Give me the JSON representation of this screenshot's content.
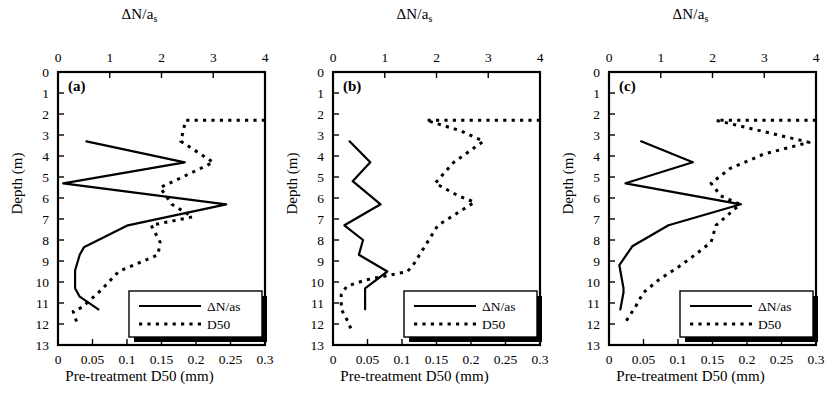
{
  "figure": {
    "width": 838,
    "height": 402,
    "background": "#ffffff",
    "line_color": "#000000"
  },
  "axes": {
    "top_title_main": "ΔN/a",
    "top_title_sub": "s",
    "bottom_title": "Pre-treatment D50 (mm)",
    "y_title": "Depth (m)",
    "top_ticks": [
      "0",
      "1",
      "2",
      "3",
      "4"
    ],
    "bottom_ticks": [
      "0",
      "0.05",
      "0.1",
      "0.15",
      "0.2",
      "0.25",
      "0.3"
    ],
    "y_ticks": [
      "0",
      "1",
      "2",
      "3",
      "4",
      "5",
      "6",
      "7",
      "8",
      "9",
      "10",
      "11",
      "12",
      "13"
    ]
  },
  "legend": {
    "series_solid_label": "ΔN/as",
    "series_dotted_label": "D50"
  },
  "chart_data": [
    {
      "type": "line",
      "panel": "a",
      "label": "(a)",
      "title": "",
      "xlabel": "Pre-treatment D50 (mm)",
      "xlabel_top": "ΔN/as",
      "ylabel": "Depth (m)",
      "ylim": [
        0,
        13
      ],
      "y_inverted": true,
      "xlim_top": [
        0,
        4
      ],
      "xlim_bottom": [
        0,
        0.3
      ],
      "grid": false,
      "legend_position": "bottom-right",
      "series": [
        {
          "name": "ΔN/as",
          "style": "solid",
          "axis": "top",
          "points": [
            {
              "x": 0.55,
              "depth": 3.3
            },
            {
              "x": 2.45,
              "depth": 4.3
            },
            {
              "x": 0.1,
              "depth": 5.3
            },
            {
              "x": 3.25,
              "depth": 6.3
            },
            {
              "x": 1.35,
              "depth": 7.3
            },
            {
              "x": 0.5,
              "depth": 8.35
            },
            {
              "x": 0.42,
              "depth": 8.7
            },
            {
              "x": 0.33,
              "depth": 9.45
            },
            {
              "x": 0.33,
              "depth": 10.3
            },
            {
              "x": 0.42,
              "depth": 10.7
            },
            {
              "x": 0.78,
              "depth": 11.3
            }
          ]
        },
        {
          "name": "D50",
          "style": "dotted",
          "axis": "bottom",
          "points": [
            {
              "x": 0.3,
              "depth": 2.3
            },
            {
              "x": 0.185,
              "depth": 2.3
            },
            {
              "x": 0.178,
              "depth": 3.3
            },
            {
              "x": 0.225,
              "depth": 4.3
            },
            {
              "x": 0.168,
              "depth": 5.2
            },
            {
              "x": 0.148,
              "depth": 5.5
            },
            {
              "x": 0.165,
              "depth": 6.3
            },
            {
              "x": 0.195,
              "depth": 6.9
            },
            {
              "x": 0.135,
              "depth": 7.3
            },
            {
              "x": 0.148,
              "depth": 8.1
            },
            {
              "x": 0.145,
              "depth": 8.7
            },
            {
              "x": 0.088,
              "depth": 9.5
            },
            {
              "x": 0.062,
              "depth": 10.4
            },
            {
              "x": 0.035,
              "depth": 11.2
            },
            {
              "x": 0.022,
              "depth": 11.4
            },
            {
              "x": 0.028,
              "depth": 12.0
            }
          ]
        }
      ]
    },
    {
      "type": "line",
      "panel": "b",
      "label": "(b)",
      "title": "",
      "xlabel": "Pre-treatment D50 (mm)",
      "xlabel_top": "ΔN/as",
      "ylabel": "Depth (m)",
      "ylim": [
        0,
        13
      ],
      "y_inverted": true,
      "xlim_top": [
        0,
        4
      ],
      "xlim_bottom": [
        0,
        0.3
      ],
      "grid": false,
      "legend_position": "bottom-right",
      "series": [
        {
          "name": "ΔN/as",
          "style": "solid",
          "axis": "top",
          "points": [
            {
              "x": 0.32,
              "depth": 3.3
            },
            {
              "x": 0.72,
              "depth": 4.3
            },
            {
              "x": 0.38,
              "depth": 5.2
            },
            {
              "x": 0.92,
              "depth": 6.3
            },
            {
              "x": 0.22,
              "depth": 7.3
            },
            {
              "x": 0.58,
              "depth": 8.0
            },
            {
              "x": 0.5,
              "depth": 8.7
            },
            {
              "x": 1.05,
              "depth": 9.5
            },
            {
              "x": 0.62,
              "depth": 10.3
            },
            {
              "x": 0.62,
              "depth": 11.3
            }
          ]
        },
        {
          "name": "D50",
          "style": "dotted",
          "axis": "bottom",
          "points": [
            {
              "x": 0.3,
              "depth": 2.3
            },
            {
              "x": 0.135,
              "depth": 2.3
            },
            {
              "x": 0.185,
              "depth": 2.8
            },
            {
              "x": 0.218,
              "depth": 3.3
            },
            {
              "x": 0.175,
              "depth": 4.3
            },
            {
              "x": 0.148,
              "depth": 5.3
            },
            {
              "x": 0.182,
              "depth": 5.9
            },
            {
              "x": 0.205,
              "depth": 6.2
            },
            {
              "x": 0.152,
              "depth": 7.3
            },
            {
              "x": 0.135,
              "depth": 8.2
            },
            {
              "x": 0.118,
              "depth": 9.1
            },
            {
              "x": 0.108,
              "depth": 9.5
            },
            {
              "x": 0.048,
              "depth": 9.9
            },
            {
              "x": 0.02,
              "depth": 10.2
            },
            {
              "x": 0.012,
              "depth": 10.6
            },
            {
              "x": 0.012,
              "depth": 11.3
            },
            {
              "x": 0.022,
              "depth": 11.9
            },
            {
              "x": 0.028,
              "depth": 12.4
            }
          ]
        }
      ]
    },
    {
      "type": "line",
      "panel": "c",
      "label": "(c)",
      "title": "",
      "xlabel": "Pre-treatment D50 (mm)",
      "xlabel_top": "ΔN/as",
      "ylabel": "Depth (m)",
      "ylim": [
        0,
        13
      ],
      "y_inverted": true,
      "xlim_top": [
        0,
        4
      ],
      "xlim_bottom": [
        0,
        0.3
      ],
      "grid": false,
      "legend_position": "bottom-right",
      "series": [
        {
          "name": "ΔN/as",
          "style": "solid",
          "axis": "top",
          "points": [
            {
              "x": 0.62,
              "depth": 3.3
            },
            {
              "x": 1.62,
              "depth": 4.3
            },
            {
              "x": 0.32,
              "depth": 5.3
            },
            {
              "x": 2.55,
              "depth": 6.3
            },
            {
              "x": 1.15,
              "depth": 7.3
            },
            {
              "x": 0.45,
              "depth": 8.3
            },
            {
              "x": 0.2,
              "depth": 9.2
            },
            {
              "x": 0.28,
              "depth": 10.3
            },
            {
              "x": 0.28,
              "depth": 10.5
            },
            {
              "x": 0.22,
              "depth": 11.3
            }
          ]
        },
        {
          "name": "D50",
          "style": "dotted",
          "axis": "bottom",
          "points": [
            {
              "x": 0.3,
              "depth": 2.3
            },
            {
              "x": 0.155,
              "depth": 2.3
            },
            {
              "x": 0.29,
              "depth": 3.35
            },
            {
              "x": 0.225,
              "depth": 3.9
            },
            {
              "x": 0.175,
              "depth": 4.6
            },
            {
              "x": 0.148,
              "depth": 5.3
            },
            {
              "x": 0.162,
              "depth": 5.9
            },
            {
              "x": 0.19,
              "depth": 6.3
            },
            {
              "x": 0.155,
              "depth": 7.3
            },
            {
              "x": 0.148,
              "depth": 8.1
            },
            {
              "x": 0.125,
              "depth": 8.7
            },
            {
              "x": 0.1,
              "depth": 9.3
            },
            {
              "x": 0.072,
              "depth": 9.9
            },
            {
              "x": 0.05,
              "depth": 10.5
            },
            {
              "x": 0.038,
              "depth": 11.2
            },
            {
              "x": 0.03,
              "depth": 11.6
            },
            {
              "x": 0.022,
              "depth": 12.0
            }
          ]
        }
      ]
    }
  ]
}
